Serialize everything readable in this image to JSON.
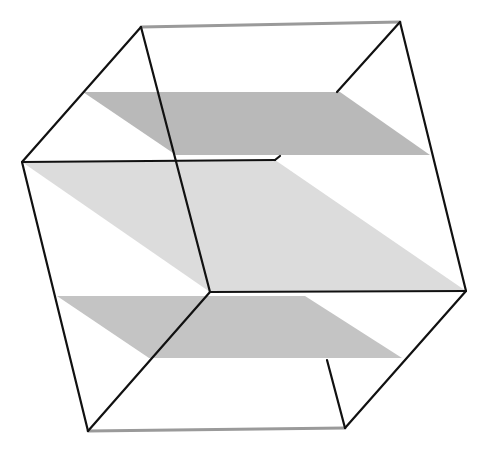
{
  "diagram": {
    "title": "",
    "colors": {
      "background": "#ffffff",
      "edge": "#111111",
      "hidden_edge": "#9a9a9a",
      "upper_plane": "#b9b9b9",
      "middle_plane": "#dcdcdc",
      "lower_plane": "#c4c4c4"
    },
    "planes": [
      {
        "name": "upper-plane",
        "points": "83,92 340,92 430,155 176,155"
      },
      {
        "name": "middle-plane",
        "points": "22,162 275,160 466,291 210,292"
      },
      {
        "name": "lower-plane",
        "points": "57,296 305,296 402,358 149,358"
      }
    ],
    "edges": [
      {
        "name": "edge-top-back",
        "x1": 141,
        "y1": 27,
        "x2": 400,
        "y2": 22,
        "style": "hidden"
      },
      {
        "name": "edge-bottom-back",
        "x1": 88,
        "y1": 431,
        "x2": 345,
        "y2": 428,
        "style": "hidden"
      },
      {
        "name": "edge-top-left-diag",
        "x1": 141,
        "y1": 27,
        "x2": 22,
        "y2": 162,
        "style": "solid"
      },
      {
        "name": "edge-top-center-vertical",
        "x1": 141,
        "y1": 27,
        "x2": 210,
        "y2": 292,
        "style": "solid"
      },
      {
        "name": "edge-top-right-diag",
        "x1": 400,
        "y1": 22,
        "x2": 337,
        "y2": 92,
        "style": "solid"
      },
      {
        "name": "edge-right-vertical",
        "x1": 400,
        "y1": 22,
        "x2": 466,
        "y2": 291,
        "style": "solid"
      },
      {
        "name": "edge-left-horizontal",
        "x1": 22,
        "y1": 162,
        "x2": 275,
        "y2": 160,
        "style": "solid"
      },
      {
        "name": "edge-left-notch",
        "x1": 275,
        "y1": 160,
        "x2": 280,
        "y2": 156,
        "style": "solid"
      },
      {
        "name": "edge-left-vertical",
        "x1": 22,
        "y1": 162,
        "x2": 88,
        "y2": 431,
        "style": "solid"
      },
      {
        "name": "edge-center-horizontal",
        "x1": 210,
        "y1": 292,
        "x2": 466,
        "y2": 291,
        "style": "solid"
      },
      {
        "name": "edge-center-bottom-diag",
        "x1": 210,
        "y1": 292,
        "x2": 88,
        "y2": 431,
        "style": "solid"
      },
      {
        "name": "edge-right-bottom-diag",
        "x1": 466,
        "y1": 291,
        "x2": 345,
        "y2": 428,
        "style": "solid"
      },
      {
        "name": "edge-bottom-right-vertical",
        "x1": 327,
        "y1": 360,
        "x2": 345,
        "y2": 428,
        "style": "solid"
      }
    ]
  }
}
